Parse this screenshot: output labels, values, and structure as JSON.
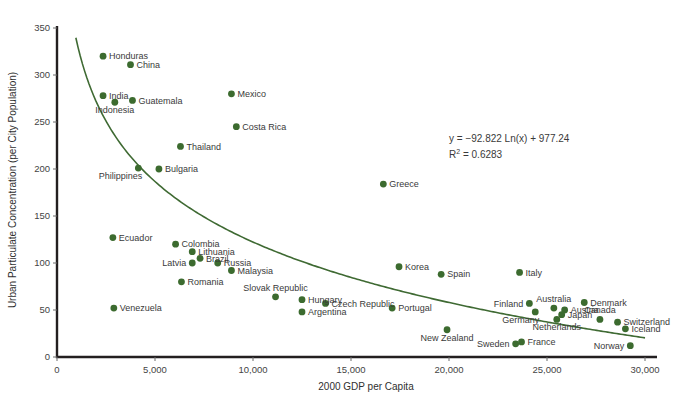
{
  "chart_data": {
    "type": "scatter",
    "title": "",
    "xlabel": "2000 GDP per Capita",
    "ylabel": "Urban Particulate Concentration (per City Population)",
    "xlim": [
      0,
      30000
    ],
    "ylim": [
      0,
      350
    ],
    "xticks": [
      0,
      5000,
      10000,
      15000,
      20000,
      25000,
      30000
    ],
    "xticklabels": [
      "0",
      "5,000",
      "10,000",
      "15,000",
      "20,000",
      "25,000",
      "30,000"
    ],
    "yticks": [
      0,
      50,
      100,
      150,
      200,
      250,
      300,
      350
    ],
    "yticklabels": [
      "0",
      "50",
      "100",
      "150",
      "200",
      "250",
      "300",
      "350"
    ],
    "grid": false,
    "legend": null,
    "annotations": {
      "equation": "y = −92.822 Ln(x) + 977.24",
      "r_squared_prefix": "R",
      "r_squared_sup": "2",
      "r_squared_value": " = 0.6283"
    },
    "trendline": {
      "type": "logarithmic",
      "slope": -92.822,
      "intercept": 977.24,
      "r2": 0.6283,
      "x_start": 850,
      "x_end": 30000
    },
    "points": [
      {
        "label": "Honduras",
        "x": 2350,
        "y": 320,
        "label_pos": "right"
      },
      {
        "label": "China",
        "x": 3750,
        "y": 311,
        "label_pos": "right"
      },
      {
        "label": "India",
        "x": 2350,
        "y": 278,
        "label_pos": "right"
      },
      {
        "label": "Indonesia",
        "x": 2950,
        "y": 271,
        "label_pos": "below"
      },
      {
        "label": "Guatemala",
        "x": 3850,
        "y": 273,
        "label_pos": "right"
      },
      {
        "label": "Mexico",
        "x": 8900,
        "y": 280,
        "label_pos": "right"
      },
      {
        "label": "Costa Rica",
        "x": 9150,
        "y": 245,
        "label_pos": "right"
      },
      {
        "label": "Thailand",
        "x": 6300,
        "y": 224,
        "label_pos": "right"
      },
      {
        "label": "Bulgaria",
        "x": 5200,
        "y": 200,
        "label_pos": "right"
      },
      {
        "label": "Philippines",
        "x": 4150,
        "y": 201,
        "label_pos": "below-left"
      },
      {
        "label": "Greece",
        "x": 16650,
        "y": 184,
        "label_pos": "right"
      },
      {
        "label": "Ecuador",
        "x": 2850,
        "y": 127,
        "label_pos": "right"
      },
      {
        "label": "Colombia",
        "x": 6050,
        "y": 120,
        "label_pos": "right"
      },
      {
        "label": "Lithuania",
        "x": 6900,
        "y": 112,
        "label_pos": "right"
      },
      {
        "label": "Brazil",
        "x": 7300,
        "y": 105,
        "label_pos": "right"
      },
      {
        "label": "Latvia",
        "x": 6900,
        "y": 100,
        "label_pos": "left"
      },
      {
        "label": "Russia",
        "x": 8200,
        "y": 100,
        "label_pos": "right"
      },
      {
        "label": "Malaysia",
        "x": 8900,
        "y": 92,
        "label_pos": "right"
      },
      {
        "label": "Romania",
        "x": 6350,
        "y": 80,
        "label_pos": "right"
      },
      {
        "label": "Korea",
        "x": 17450,
        "y": 96,
        "label_pos": "right"
      },
      {
        "label": "Spain",
        "x": 19600,
        "y": 88,
        "label_pos": "right"
      },
      {
        "label": "Italy",
        "x": 23600,
        "y": 90,
        "label_pos": "right"
      },
      {
        "label": "Slovak Republic",
        "x": 11150,
        "y": 64,
        "label_pos": "above"
      },
      {
        "label": "Hungary",
        "x": 12500,
        "y": 61,
        "label_pos": "right"
      },
      {
        "label": "Czech Republic",
        "x": 13700,
        "y": 57,
        "label_pos": "right"
      },
      {
        "label": "Argentina",
        "x": 12500,
        "y": 48,
        "label_pos": "right"
      },
      {
        "label": "Portugal",
        "x": 17100,
        "y": 52,
        "label_pos": "right"
      },
      {
        "label": "Venezuela",
        "x": 2900,
        "y": 52,
        "label_pos": "right"
      },
      {
        "label": "Finland",
        "x": 24100,
        "y": 57,
        "label_pos": "left"
      },
      {
        "label": "Germany",
        "x": 24400,
        "y": 48,
        "label_pos": "below-left"
      },
      {
        "label": "Australia",
        "x": 25350,
        "y": 52,
        "label_pos": "above"
      },
      {
        "label": "Austria",
        "x": 25900,
        "y": 50,
        "label_pos": "right"
      },
      {
        "label": "Japan",
        "x": 25750,
        "y": 45,
        "label_pos": "right"
      },
      {
        "label": "Netherlands",
        "x": 25500,
        "y": 40,
        "label_pos": "below"
      },
      {
        "label": "Denmark",
        "x": 26900,
        "y": 58,
        "label_pos": "right"
      },
      {
        "label": "Canada",
        "x": 27700,
        "y": 40,
        "label_pos": "above"
      },
      {
        "label": "Switzerland",
        "x": 28600,
        "y": 37,
        "label_pos": "right"
      },
      {
        "label": "Iceland",
        "x": 29000,
        "y": 30,
        "label_pos": "right"
      },
      {
        "label": "Norway",
        "x": 29250,
        "y": 12,
        "label_pos": "left"
      },
      {
        "label": "New Zealand",
        "x": 19900,
        "y": 29,
        "label_pos": "below"
      },
      {
        "label": "Sweden",
        "x": 23400,
        "y": 14,
        "label_pos": "left"
      },
      {
        "label": "France",
        "x": 23700,
        "y": 16,
        "label_pos": "right"
      }
    ],
    "colors": {
      "marker": "#3c6b2f",
      "trendline": "#3f6a33",
      "axis": "#231f20",
      "text": "#3f3f3f",
      "background": "#ffffff"
    }
  }
}
